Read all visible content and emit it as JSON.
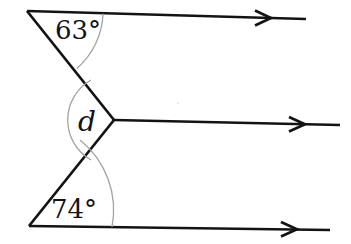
{
  "diagram": {
    "angle_labels": {
      "top": "63°",
      "middle": "d",
      "bottom": "74°"
    },
    "line_color": "#131313",
    "arc_color": "#a3a3a3",
    "label_color": "#131313",
    "background": "#ffffff"
  }
}
